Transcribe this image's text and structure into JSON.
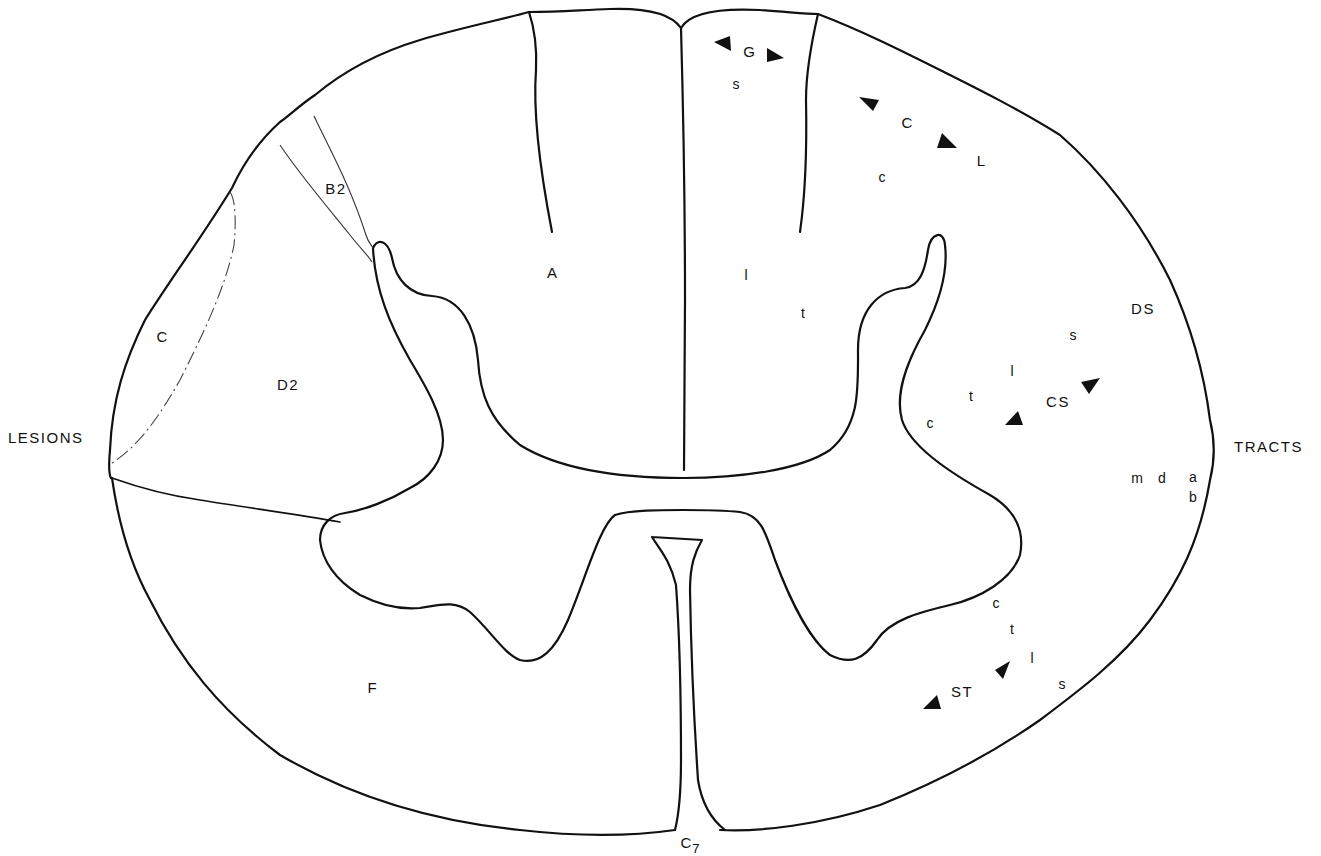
{
  "figure": {
    "level_label": "C",
    "level_subscript": "7",
    "left_heading": "LESIONS",
    "right_heading": "TRACTS",
    "line_color": "#111111",
    "background": "#ffffff"
  },
  "lesions": {
    "A": "A",
    "B2": "B2",
    "C": "C",
    "D2": "D2",
    "F": "F"
  },
  "tracts": {
    "gracile": {
      "label": "G",
      "lamination": [
        "s"
      ]
    },
    "corticospinal_lateral": {
      "label": "C",
      "label2": "L",
      "lamination": [
        "c"
      ]
    },
    "dorsal_column_laminae": {
      "l": "l",
      "t": "t"
    },
    "dorsal_spinocerebellar": {
      "label": "DS"
    },
    "lateral_corticospinal": {
      "label": "CS",
      "lamination": [
        "s",
        "l",
        "t",
        "c"
      ]
    },
    "ventral_spinocerebellar_letters": {
      "m": "m",
      "d": "d",
      "a": "a",
      "b": "b"
    },
    "spinothalamic": {
      "label": "ST",
      "lamination": [
        "c",
        "t",
        "l",
        "s"
      ]
    }
  },
  "arrows": [
    {
      "name": "gracile-left-arrow",
      "direction": "left"
    },
    {
      "name": "gracile-right-arrow",
      "direction": "right"
    },
    {
      "name": "cuneate-upper-arrow",
      "direction": "up-left"
    },
    {
      "name": "cuneate-lower-arrow",
      "direction": "down-right"
    },
    {
      "name": "cs-upper-arrow",
      "direction": "up-right"
    },
    {
      "name": "cs-lower-arrow",
      "direction": "down-left"
    },
    {
      "name": "st-upper-arrow",
      "direction": "up-right"
    },
    {
      "name": "st-lower-arrow",
      "direction": "down-left"
    }
  ]
}
